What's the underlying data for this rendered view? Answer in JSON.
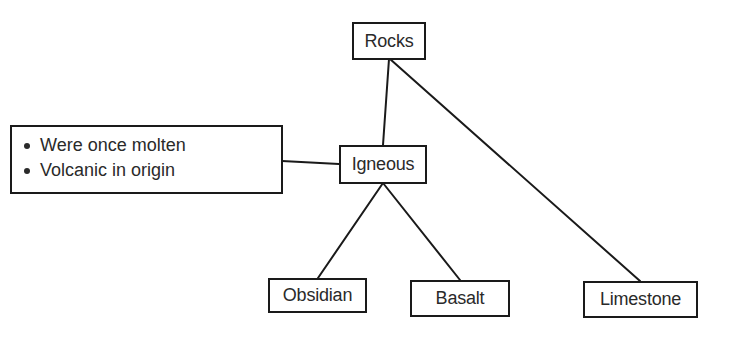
{
  "diagram": {
    "type": "tree",
    "title": "",
    "stroke_color": "#1a1a1a",
    "text_color": "#2a2a2a",
    "nodes": {
      "rocks": {
        "label": "Rocks"
      },
      "igneous": {
        "label": "Igneous"
      },
      "obsidian": {
        "label": "Obsidian"
      },
      "basalt": {
        "label": "Basalt"
      },
      "limestone": {
        "label": "Limestone"
      }
    },
    "callout": {
      "attached_to": "Igneous",
      "items": [
        "Were once molten",
        "Volcanic in origin"
      ]
    },
    "edges": [
      {
        "from": "Rocks",
        "to": "Igneous"
      },
      {
        "from": "Rocks",
        "to": "Limestone"
      },
      {
        "from": "Igneous",
        "to": "Obsidian"
      },
      {
        "from": "Igneous",
        "to": "Basalt"
      },
      {
        "from": "Igneous",
        "to": "Callout"
      }
    ]
  }
}
